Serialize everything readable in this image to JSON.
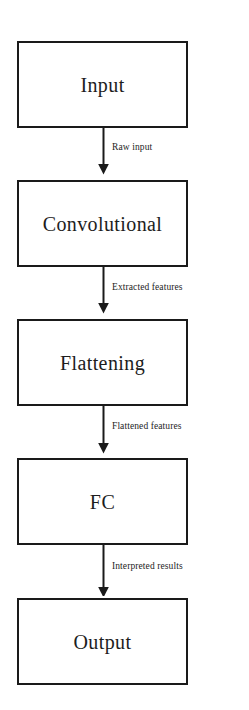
{
  "diagram": {
    "type": "flowchart",
    "orientation": "vertical",
    "canvas": {
      "width": 249,
      "height": 710,
      "background": "#ffffff"
    },
    "style": {
      "box_border_color": "#1a1a1a",
      "box_fill": "#ffffff",
      "text_color": "#1d1d1d",
      "arrow_color": "#1a1a1a"
    },
    "nodes": [
      {
        "id": "input",
        "label": "Input"
      },
      {
        "id": "convolutional",
        "label": "Convolutional"
      },
      {
        "id": "flattening",
        "label": "Flattening"
      },
      {
        "id": "fc",
        "label": "FC"
      },
      {
        "id": "output",
        "label": "Output"
      }
    ],
    "edges": [
      {
        "id": "edge-1",
        "from": "input",
        "to": "convolutional",
        "label": "Raw input"
      },
      {
        "id": "edge-2",
        "from": "convolutional",
        "to": "flattening",
        "label": "Extracted features"
      },
      {
        "id": "edge-3",
        "from": "flattening",
        "to": "fc",
        "label": "Flattened features"
      },
      {
        "id": "edge-4",
        "from": "fc",
        "to": "output",
        "label": "Interpreted results"
      }
    ]
  }
}
